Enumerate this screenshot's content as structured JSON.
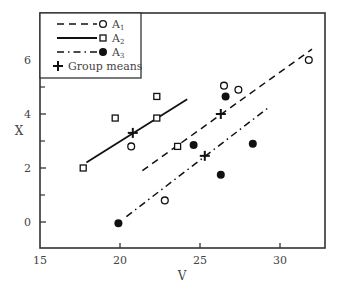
{
  "chart_data": {
    "type": "scatter",
    "title": "",
    "xlabel": "V",
    "ylabel": "X",
    "xlim": [
      15,
      32.8
    ],
    "ylim": [
      -1.0,
      7.7
    ],
    "xticks": [
      15,
      20,
      25,
      30
    ],
    "xtick_labels": [
      "15",
      "20",
      "25",
      "30"
    ],
    "yticks": [
      0,
      2,
      4,
      6
    ],
    "ytick_labels": [
      "0",
      "2",
      "4",
      "6"
    ],
    "yminor_ticks": [
      1,
      3,
      5,
      7
    ],
    "grid": false,
    "legend_position": "upper-left",
    "legend": [
      {
        "label": "A",
        "sub": "1",
        "line": "dashed",
        "marker": "open-circle"
      },
      {
        "label": "A",
        "sub": "2",
        "line": "solid",
        "marker": "open-square"
      },
      {
        "label": "A",
        "sub": "3",
        "line": "dash-dot",
        "marker": "filled-circle"
      },
      {
        "label": "Group means",
        "sub": "",
        "line": "none",
        "marker": "plus"
      }
    ],
    "series": [
      {
        "name": "A1",
        "marker": "open-circle",
        "points": [
          [
            20.7,
            2.8
          ],
          [
            22.8,
            0.8
          ],
          [
            26.5,
            5.05
          ],
          [
            27.4,
            4.9
          ],
          [
            31.8,
            6.0
          ]
        ],
        "regression_line": {
          "style": "dashed",
          "from": [
            21.4,
            1.9
          ],
          "to": [
            32.0,
            6.4
          ]
        },
        "group_mean": [
          26.3,
          4.0
        ]
      },
      {
        "name": "A2",
        "marker": "open-square",
        "points": [
          [
            17.7,
            2.0
          ],
          [
            19.7,
            3.85
          ],
          [
            22.3,
            4.65
          ],
          [
            22.3,
            3.85
          ],
          [
            23.6,
            2.8
          ]
        ],
        "regression_line": {
          "style": "solid",
          "from": [
            17.9,
            2.2
          ],
          "to": [
            24.2,
            4.55
          ]
        },
        "group_mean": [
          20.8,
          3.3
        ]
      },
      {
        "name": "A3",
        "marker": "filled-circle",
        "points": [
          [
            19.9,
            -0.05
          ],
          [
            24.6,
            2.85
          ],
          [
            26.3,
            1.75
          ],
          [
            26.6,
            4.65
          ],
          [
            28.3,
            2.9
          ]
        ],
        "regression_line": {
          "style": "dash-dot",
          "from": [
            20.4,
            0.2
          ],
          "to": [
            29.2,
            4.2
          ]
        },
        "group_mean": [
          25.3,
          2.45
        ]
      }
    ]
  }
}
